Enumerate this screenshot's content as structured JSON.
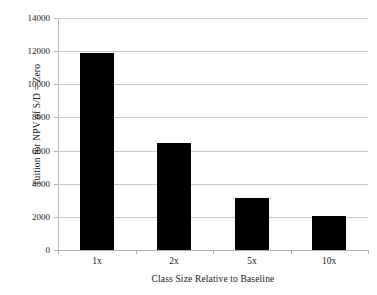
{
  "chart_data": {
    "type": "bar",
    "title": "",
    "subtitle": "",
    "xlabel": "Class Size Relative to Baseline",
    "ylabel": "Tuition for NPV of S/D = Zero",
    "categories": [
      "1x",
      "2x",
      "5x",
      "10x"
    ],
    "values": [
      11900,
      6450,
      3140,
      2050
    ],
    "series": [
      {
        "name": "Tuition for NPV of S/D = Zero",
        "values": [
          11900,
          6450,
          3140,
          2050
        ]
      }
    ],
    "ylim": [
      0,
      14000
    ],
    "ytick_values": [
      0,
      2000,
      4000,
      6000,
      8000,
      10000,
      12000,
      14000
    ],
    "ytick_labels": [
      "0",
      "2000",
      "4000",
      "6000",
      "8000",
      "10000",
      "12000",
      "14000"
    ],
    "xtick_labels": [
      "1x",
      "2x",
      "5x",
      "10x"
    ],
    "grid": true,
    "grid_axis": "y",
    "legend": false,
    "legend_position": "none",
    "bar_color": "#000000",
    "grid_color": "#c8c8c8",
    "axis_color": "#b0b0b0",
    "background_color": "#ffffff",
    "annotations": []
  }
}
